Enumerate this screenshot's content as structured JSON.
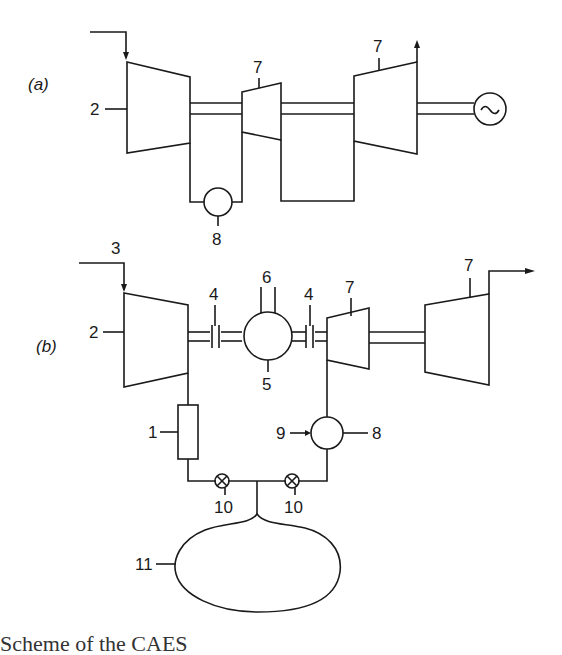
{
  "diagram": {
    "panels": [
      {
        "label": "(a)",
        "components": [
          {
            "id": "2",
            "name": "compressor"
          },
          {
            "id": "7",
            "name": "HP turbine"
          },
          {
            "id": "7",
            "name": "LP turbine"
          },
          {
            "id": "8",
            "name": "combustor"
          },
          {
            "id": "~",
            "name": "generator"
          }
        ]
      },
      {
        "label": "(b)",
        "components": [
          {
            "id": "1",
            "name": "heat exchanger / cooler"
          },
          {
            "id": "2",
            "name": "compressor"
          },
          {
            "id": "3",
            "name": "air inlet"
          },
          {
            "id": "4",
            "name": "clutch"
          },
          {
            "id": "4",
            "name": "clutch"
          },
          {
            "id": "5",
            "name": "motor/generator"
          },
          {
            "id": "6",
            "name": "electrical connection"
          },
          {
            "id": "7",
            "name": "HP turbine"
          },
          {
            "id": "7",
            "name": "LP turbine"
          },
          {
            "id": "8",
            "name": "combustor"
          },
          {
            "id": "9",
            "name": "fuel inlet"
          },
          {
            "id": "10",
            "name": "valve"
          },
          {
            "id": "10",
            "name": "valve"
          },
          {
            "id": "11",
            "name": "underground air store"
          }
        ]
      }
    ],
    "labels": {
      "a": {
        "panel": "(a)",
        "n2": "2",
        "n7a": "7",
        "n7b": "7",
        "n8": "8",
        "gen": "~"
      },
      "b": {
        "panel": "(b)",
        "n1": "1",
        "n2": "2",
        "n3": "3",
        "n4a": "4",
        "n4b": "4",
        "n5": "5",
        "n6": "6",
        "n7a": "7",
        "n7b": "7",
        "n8": "8",
        "n9": "9",
        "n10a": "10",
        "n10b": "10",
        "n11": "11"
      }
    },
    "caption": "Scheme of the CAES"
  }
}
